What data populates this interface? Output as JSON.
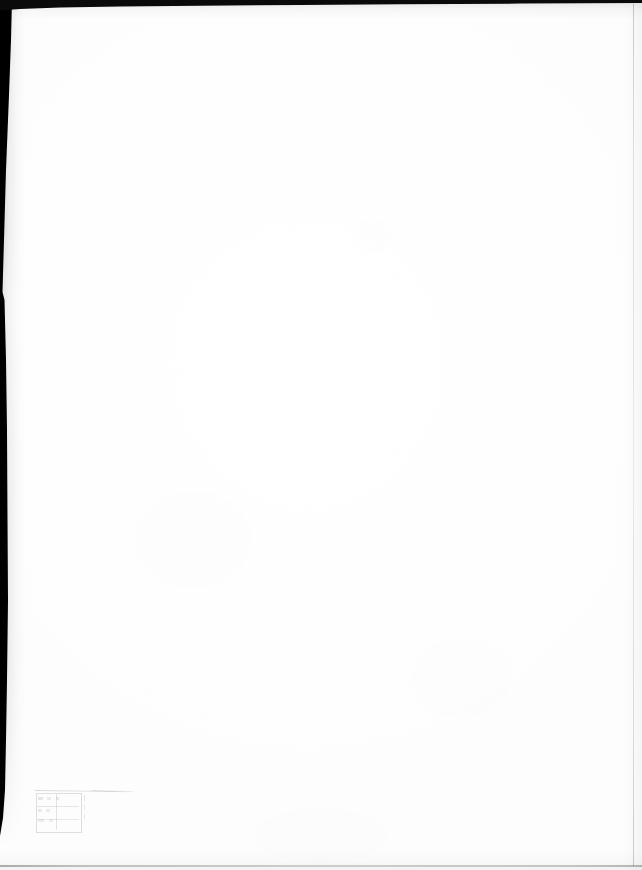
{
  "document": {
    "kind": "scanned-page",
    "title": "Scanned blank page",
    "page_width": 642,
    "page_height": 870,
    "paper_color": "#ffffff",
    "body_text": "",
    "body_note": "Page body is blank — no printed text, figures or rules are present."
  },
  "artifacts": {
    "gutter_shadow": {
      "name": "left-gutter-shadow",
      "color": "#000000",
      "edge": "left",
      "max_width_px": 12,
      "ends_at_y_px": 836
    },
    "top_edge_strip": {
      "name": "top-edge-strip",
      "color": "#0a0a0a",
      "edge": "top",
      "max_thickness_px": 10
    },
    "bottom_edge_rule": {
      "name": "bottom-edge-rule",
      "color": "#000000",
      "edge": "bottom",
      "y_px": 865
    },
    "right_edge_rule": {
      "name": "right-edge-rule",
      "color": "#000000",
      "edge": "right",
      "x_px": 633
    }
  },
  "stamp": {
    "name": "faint-stamp-impression",
    "position": "lower-left",
    "x_px": 34,
    "y_px": 781,
    "width_px": 104,
    "height_px": 53,
    "legible": false,
    "caption": "",
    "caption_note": "A single line of very small text sits above a ruled box; the ink is too faint to resolve any characters.",
    "box_note": "Rectangular ruled box with one vertical and two horizontal inner rules, containing smudged illegible glyphs."
  }
}
